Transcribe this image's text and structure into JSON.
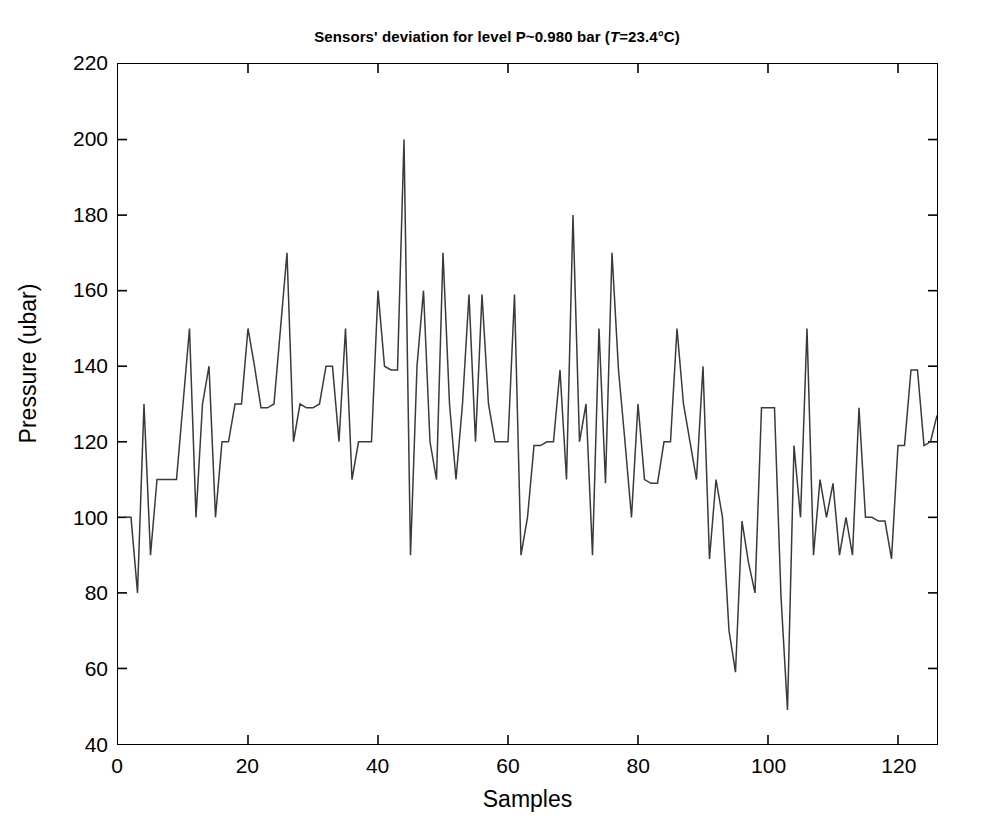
{
  "figure": {
    "title_prefix": "Sensors' deviation for level P~0.980 bar (",
    "title_italic": "T",
    "title_suffix": "=23.4°C)",
    "title_full": "Sensors' deviation for level P~0.980 bar (T=23.4°C)",
    "background_color": "#ffffff",
    "line_color": "#3a3a3a",
    "axis_color": "#000000"
  },
  "chart_data": {
    "type": "line",
    "title": "Sensors' deviation for level P~0.980 bar (T=23.4°C)",
    "xlabel": "Samples",
    "ylabel": "Pressure (ubar)",
    "xlim": [
      0,
      126
    ],
    "ylim": [
      40,
      220
    ],
    "xticks": [
      0,
      20,
      40,
      60,
      80,
      100,
      120
    ],
    "xtick_labels": [
      "0",
      "20",
      "40",
      "60",
      "80",
      "100",
      "120"
    ],
    "yticks": [
      40,
      60,
      80,
      100,
      120,
      140,
      160,
      180,
      200,
      220
    ],
    "ytick_labels": [
      "40",
      "60",
      "80",
      "100",
      "120",
      "140",
      "160",
      "180",
      "200",
      "220"
    ],
    "grid": false,
    "legend": null,
    "series": [
      {
        "name": "Sensor deviation",
        "color": "#3a3a3a",
        "x": [
          1,
          2,
          3,
          4,
          5,
          6,
          7,
          8,
          9,
          10,
          11,
          12,
          13,
          14,
          15,
          16,
          17,
          18,
          19,
          20,
          21,
          22,
          23,
          24,
          25,
          26,
          27,
          28,
          29,
          30,
          31,
          32,
          33,
          34,
          35,
          36,
          37,
          38,
          39,
          40,
          41,
          42,
          43,
          44,
          45,
          46,
          47,
          48,
          49,
          50,
          51,
          52,
          53,
          54,
          55,
          56,
          57,
          58,
          59,
          60,
          61,
          62,
          63,
          64,
          65,
          66,
          67,
          68,
          69,
          70,
          71,
          72,
          73,
          74,
          75,
          76,
          77,
          78,
          79,
          80,
          81,
          82,
          83,
          84,
          85,
          86,
          87,
          88,
          89,
          90,
          91,
          92,
          93,
          94,
          95,
          96,
          97,
          98,
          99,
          100,
          101,
          102,
          103,
          104,
          105,
          106,
          107,
          108,
          109,
          110,
          111,
          112,
          113,
          114,
          115,
          116,
          117,
          118,
          119,
          120,
          121,
          122,
          123,
          124,
          125,
          126
        ],
        "y": [
          100,
          100,
          80,
          130,
          90,
          110,
          110,
          110,
          110,
          130,
          150,
          100,
          130,
          140,
          100,
          120,
          120,
          130,
          130,
          150,
          140,
          129,
          129,
          130,
          150,
          170,
          120,
          130,
          129,
          129,
          130,
          140,
          140,
          120,
          150,
          110,
          120,
          120,
          120,
          160,
          140,
          139,
          139,
          200,
          90,
          140,
          160,
          120,
          110,
          170,
          130,
          110,
          130,
          159,
          120,
          159,
          130,
          120,
          120,
          120,
          159,
          90,
          100,
          119,
          119,
          120,
          120,
          139,
          110,
          180,
          120,
          130,
          90,
          150,
          109,
          170,
          139,
          120,
          100,
          130,
          110,
          109,
          109,
          120,
          120,
          150,
          130,
          120,
          110,
          140,
          89,
          110,
          100,
          70,
          59,
          99,
          88,
          80,
          129,
          129,
          129,
          79,
          49,
          119,
          100,
          150,
          90,
          110,
          100,
          109,
          90,
          100,
          90,
          129,
          100,
          100,
          99,
          99,
          89,
          119,
          119,
          139,
          139,
          119,
          120,
          127
        ]
      }
    ]
  },
  "axes": {
    "x_label": "Samples",
    "y_label": "Pressure (ubar)"
  }
}
